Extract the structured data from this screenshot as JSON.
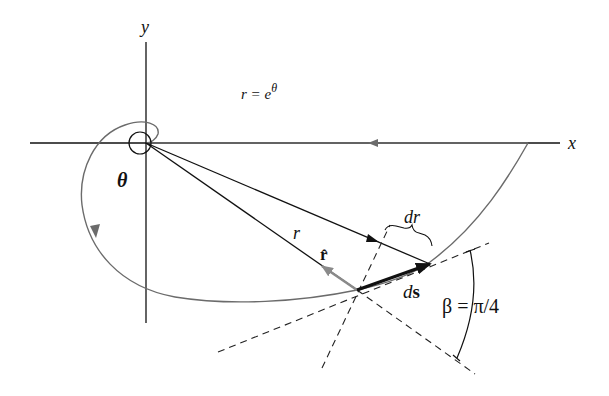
{
  "diagram": {
    "axes": {
      "x_label": "x",
      "y_label": "y"
    },
    "equation": {
      "lhs": "r = e",
      "exponent": "θ"
    },
    "labels": {
      "theta": "θ",
      "r": "r",
      "dr": "dr",
      "r_hat": "r̂",
      "ds_d": "d",
      "ds_s": "s",
      "beta": "β = π/4"
    },
    "colors": {
      "axis": "#111111",
      "spiral": "#6b6b6b",
      "vector": "#111111",
      "dashed": "#222222",
      "r_hat": "#7a7a7a"
    },
    "points": {
      "origin": [
        146,
        143
      ],
      "P": [
        357,
        290
      ],
      "ds_tip": [
        430,
        264
      ]
    }
  }
}
